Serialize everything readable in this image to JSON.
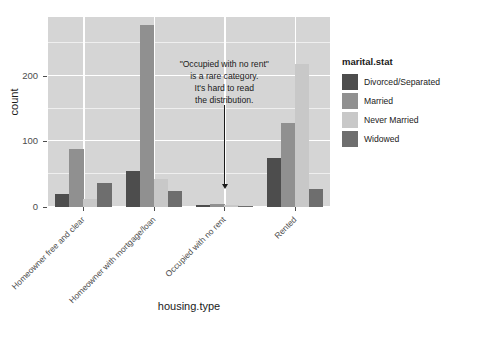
{
  "chart_data": {
    "type": "bar",
    "title": "",
    "xlabel": "housing.type",
    "ylabel": "count",
    "categories": [
      "Homeowner free and clear",
      "Homeowner with mortgage/loan",
      "Occupied with no rent",
      "Rented"
    ],
    "series": [
      {
        "name": "Divorced/Separated",
        "color": "#4d4d4d",
        "values": [
          20,
          55,
          3,
          75
        ]
      },
      {
        "name": "Married",
        "color": "#909090",
        "values": [
          88,
          278,
          4,
          128
        ]
      },
      {
        "name": "Never Married",
        "color": "#c8c8c8",
        "values": [
          12,
          42,
          3,
          218
        ]
      },
      {
        "name": "Widowed",
        "color": "#6e6e6e",
        "values": [
          37,
          25,
          2,
          28
        ]
      }
    ],
    "legend_title": "marital.stat",
    "legend_position": "right",
    "ylim": [
      0,
      290
    ],
    "yticks": [
      0,
      100,
      200
    ],
    "ytick_labels": [
      "0",
      "100",
      "200"
    ],
    "grid": true,
    "grid_color": "#ffffff",
    "panel_background": "#d5d5d5",
    "annotation": {
      "lines": [
        "\"Occupied with no rent\"",
        "is a rare category.",
        "It's hard to read",
        "the distribution."
      ],
      "points_to": "Occupied with no rent"
    }
  },
  "caption": {
    "clipped_text": ""
  }
}
